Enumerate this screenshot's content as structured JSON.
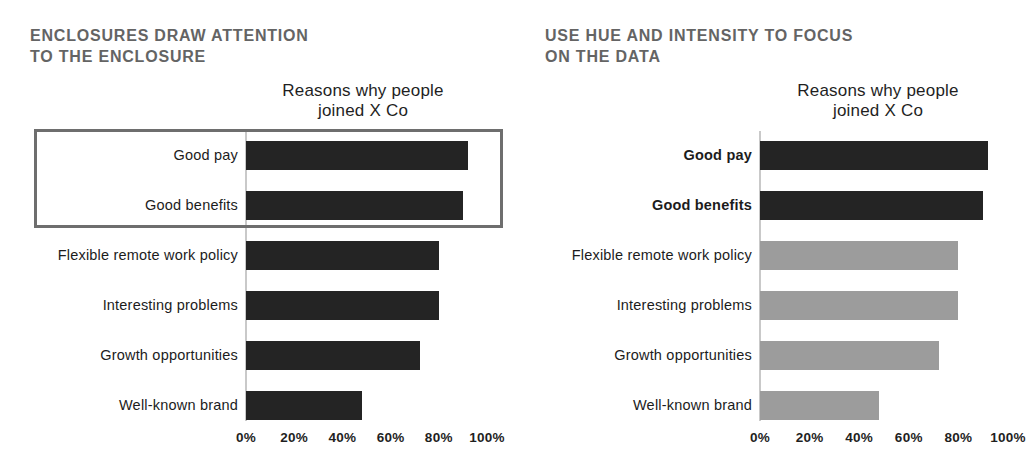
{
  "panels": {
    "left": {
      "heading_line1": "ENCLOSURES DRAW ATTENTION",
      "heading_line2": "TO THE ENCLOSURE"
    },
    "right": {
      "heading_line1": "USE HUE AND INTENSITY TO FOCUS",
      "heading_line2": "ON THE DATA"
    }
  },
  "chart_data": [
    {
      "type": "bar",
      "orientation": "horizontal",
      "title": "Reasons why people joined X Co",
      "title_line1": "Reasons why people",
      "title_line2": "joined X Co",
      "categories": [
        "Good pay",
        "Good benefits",
        "Flexible remote work policy",
        "Interesting problems",
        "Growth opportunities",
        "Well-known brand"
      ],
      "values": [
        92,
        90,
        80,
        80,
        72,
        48
      ],
      "xlim": [
        0,
        100
      ],
      "x_ticks": [
        "0%",
        "20%",
        "40%",
        "60%",
        "80%",
        "100%"
      ],
      "grid": false,
      "bar_colors": [
        "#242424",
        "#242424",
        "#242424",
        "#242424",
        "#242424",
        "#242424"
      ],
      "bold_labels": [
        false,
        false,
        false,
        false,
        false,
        false
      ],
      "annotation": {
        "kind": "enclosure",
        "enclosed_categories": [
          "Good pay",
          "Good benefits"
        ],
        "border_color": "#6e6e6e"
      }
    },
    {
      "type": "bar",
      "orientation": "horizontal",
      "title": "Reasons why people joined X Co",
      "title_line1": "Reasons why people",
      "title_line2": "joined X Co",
      "categories": [
        "Good pay",
        "Good benefits",
        "Flexible remote work policy",
        "Interesting problems",
        "Growth opportunities",
        "Well-known brand"
      ],
      "values": [
        92,
        90,
        80,
        80,
        72,
        48
      ],
      "xlim": [
        0,
        100
      ],
      "x_ticks": [
        "0%",
        "20%",
        "40%",
        "60%",
        "80%",
        "100%"
      ],
      "grid": false,
      "bar_colors": [
        "#242424",
        "#242424",
        "#9c9c9c",
        "#9c9c9c",
        "#9c9c9c",
        "#9c9c9c"
      ],
      "bold_labels": [
        true,
        true,
        false,
        false,
        false,
        false
      ],
      "annotation": {
        "kind": "hue-intensity",
        "emphasized_categories": [
          "Good pay",
          "Good benefits"
        ],
        "emphasis_color": "#242424",
        "deemphasis_color": "#9c9c9c"
      }
    }
  ],
  "colors": {
    "background": "#ffffff",
    "heading": "#646464",
    "title": "#1f1f1f",
    "axis_label": "#1f1f1f",
    "bar_dark": "#242424",
    "bar_gray": "#9c9c9c",
    "enclosure_border": "#6e6e6e",
    "baseline": "#c9c9c9"
  }
}
